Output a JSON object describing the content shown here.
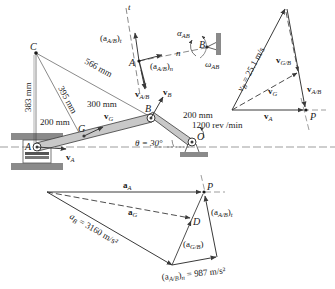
{
  "figure": {
    "mechanism": {
      "points": {
        "C": "C",
        "A": "A",
        "B": "B",
        "G": "G",
        "O": "O",
        "P": "P",
        "D": "D"
      },
      "dimensions": {
        "d_CB": "566 mm",
        "d_CG": "395 mm",
        "d_CA": "383 mm",
        "d_AG": "200 mm",
        "d_GB": "300 mm",
        "d_OB": "200 mm"
      },
      "crank_speed": "1200 rev /min",
      "theta": "θ = 30°",
      "vectors": {
        "vA": "v",
        "vA_sub": "A",
        "vG": "v",
        "vG_sub": "G",
        "vB": "v",
        "vB_sub": "B"
      }
    },
    "detail_AB": {
      "t_axis": "t",
      "n_axis": "n",
      "aAB_t": "(a",
      "aAB_t_sub": "A/B",
      "aAB_t_close": ")",
      "aAB_t_subscript": "t",
      "aAB_n": "(a",
      "aAB_n_sub": "A/B",
      "aAB_n_close": ")",
      "aAB_n_subscript": "n",
      "vAB": "v",
      "vAB_sub": "A/B",
      "alpha": "α",
      "alpha_sub": "AB",
      "omega": "ω",
      "omega_sub": "AB",
      "point_A": "A",
      "point_B": "B"
    },
    "velocity_polygon": {
      "vB_label": "v",
      "vB_sub": "B",
      "vB_value": " = 25.1 m/s",
      "vGB": "v",
      "vGB_sub": "G/B",
      "vG": "v",
      "vG_sub": "G",
      "vAB": "v",
      "vAB_sub": "A/B",
      "vA": "v",
      "vA_sub": "A",
      "P": "P"
    },
    "acceleration_polygon": {
      "aA": "a",
      "aA_sub": "A",
      "aG": "a",
      "aG_sub": "G",
      "aB": "a",
      "aB_sub": "B",
      "aB_value": " = 3160 m/s²",
      "aAB_t": "(a",
      "aAB_t_sub": "A/B",
      "aAB_t_close": ")",
      "aAB_t_subscript": "t",
      "aGB": "(a",
      "aGB_sub": "G/B",
      "aGB_close": ")",
      "aAB_n": "(a",
      "aAB_n_sub": "A/B",
      "aAB_n_close": ")",
      "aAB_n_subscript": "n",
      "aAB_n_value": " = 987 m/s²",
      "P": "P",
      "D": "D"
    },
    "colors": {
      "line": "#3a3a3a",
      "link_fill": "#c8c8c8",
      "ground": "#8a8a8a",
      "text": "#1a1a1a"
    }
  }
}
